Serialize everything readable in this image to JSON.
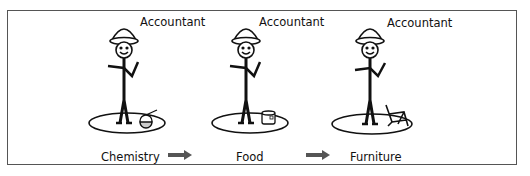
{
  "panels": [
    {
      "title": "Accountant",
      "domain": "Chemistry",
      "object": "flask-icon"
    },
    {
      "title": "Accountant",
      "domain": "Food",
      "object": "can-icon"
    },
    {
      "title": "Accountant",
      "domain": "Furniture",
      "object": "chair-icon"
    }
  ],
  "arrows": [
    "arrow-right",
    "arrow-right"
  ],
  "colors": {
    "stroke": "#111111",
    "arrow": "#555555",
    "border": "#555555"
  }
}
